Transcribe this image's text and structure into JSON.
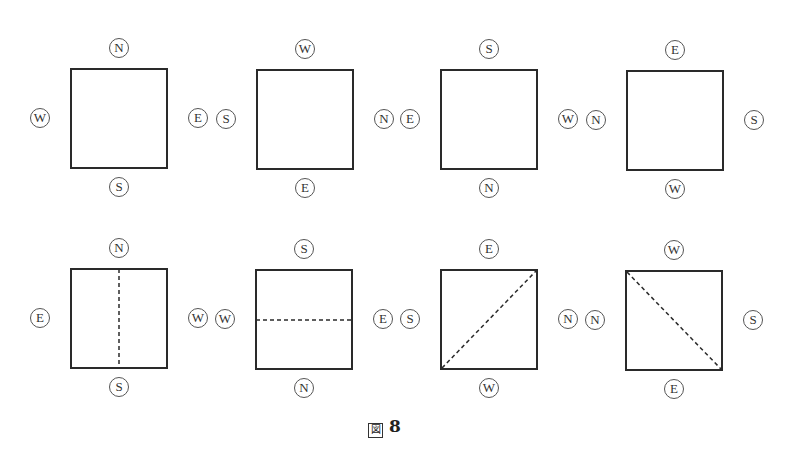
{
  "figure": {
    "caption_char": "図",
    "caption_number": "8",
    "caption": "図 8"
  },
  "panels": [
    {
      "top": "N",
      "left": "W",
      "right": "E",
      "bottom": "S",
      "fold": "none"
    },
    {
      "top": "W",
      "left": "S",
      "right": "N",
      "bottom": "E",
      "fold": "none"
    },
    {
      "top": "S",
      "left": "E",
      "right": "W",
      "bottom": "N",
      "fold": "none"
    },
    {
      "top": "E",
      "left": "N",
      "right": "S",
      "bottom": "W",
      "fold": "none"
    },
    {
      "top": "N",
      "left": "E",
      "right": "W",
      "bottom": "S",
      "fold": "vertical"
    },
    {
      "top": "S",
      "left": "W",
      "right": "E",
      "bottom": "N",
      "fold": "horizontal"
    },
    {
      "top": "E",
      "left": "S",
      "right": "N",
      "bottom": "W",
      "fold": "diagonal-bottomleft-topright"
    },
    {
      "top": "W",
      "left": "N",
      "right": "S",
      "bottom": "E",
      "fold": "diagonal-topleft-bottomright"
    }
  ],
  "colors": {
    "stroke": "#2a2a2a",
    "background": "#ffffff"
  }
}
